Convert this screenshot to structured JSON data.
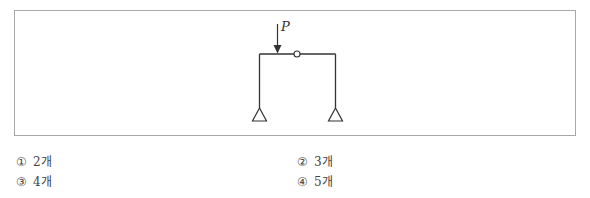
{
  "figure": {
    "load_label": "P",
    "structure": {
      "type": "portal-frame",
      "members": [
        "left-column",
        "beam",
        "right-column"
      ],
      "internal_hinge": "circle on beam",
      "supports": [
        "pin-left",
        "pin-right"
      ],
      "load": "vertical point load P on beam"
    }
  },
  "choices": [
    {
      "number": "①",
      "text": "2개"
    },
    {
      "number": "②",
      "text": "3개"
    },
    {
      "number": "③",
      "text": "4개"
    },
    {
      "number": "④",
      "text": "5개"
    }
  ],
  "colors": {
    "line": "#333333",
    "border": "#a8a8a8",
    "text": "#444444"
  }
}
